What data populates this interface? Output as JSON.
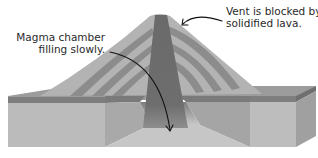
{
  "diagram": {
    "annotations": [
      {
        "id": "magma",
        "lines": [
          "Magma chamber",
          "filling slowly."
        ]
      },
      {
        "id": "vent",
        "lines": [
          "Vent is blocked by",
          "solidified lava."
        ]
      }
    ],
    "colors": {
      "background": "#ffffff",
      "ground_front": "#b9b9b9",
      "ground_side": "#a3a3a3",
      "ground_top": "#9a9a9a",
      "rock_stripe": "#7a7a7a",
      "cone_light": "#b0b0b0",
      "cone_band": "#8a8a8a",
      "vent": "#6c6c6c",
      "pit_floor": "#c4c4c4",
      "arrow": "#111111",
      "text": "#2a2a2a"
    }
  }
}
